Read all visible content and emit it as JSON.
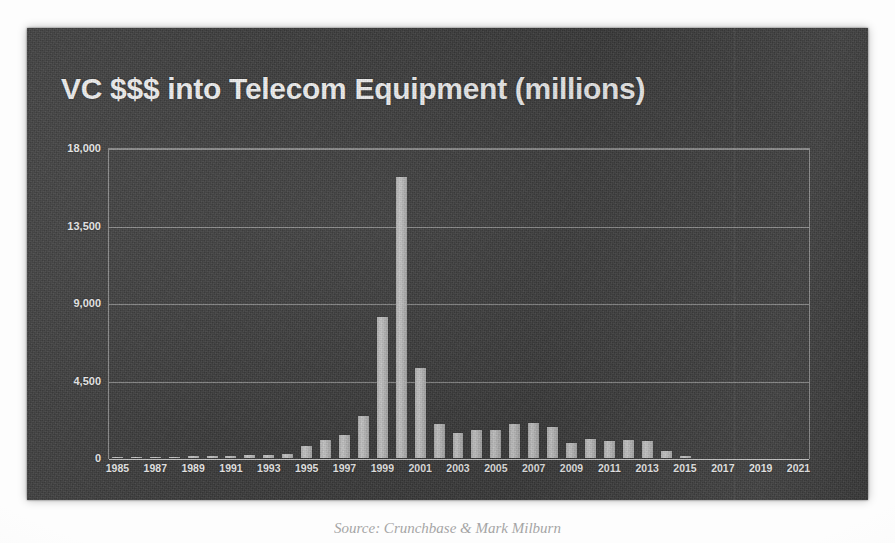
{
  "slide": {
    "title": "VC $$$ into Telecom Equipment (millions)",
    "background_color": "#3b3b3b",
    "title_color": "#f2f2f2",
    "bar_color": "#c2c2c2",
    "grid_color": "#e4e4e4"
  },
  "caption": {
    "text": "Source: Crunchbase & Mark Milburn"
  },
  "chart_data": {
    "type": "bar",
    "title": "VC $$$ into Telecom Equipment (millions)",
    "xlabel": "",
    "ylabel": "",
    "ylim": [
      0,
      18000
    ],
    "yticks": [
      0,
      4500,
      9000,
      13500,
      18000
    ],
    "ytick_labels": [
      "0",
      "4,500",
      "9,000",
      "13,500",
      "18,000"
    ],
    "grid": true,
    "legend": false,
    "xtick_labels": [
      "1985",
      "1987",
      "1989",
      "1991",
      "1993",
      "1995",
      "1997",
      "1999",
      "2001",
      "2003",
      "2005",
      "2007",
      "2009",
      "2011",
      "2013",
      "2015",
      "2017",
      "2019",
      "2021"
    ],
    "categories": [
      "1985",
      "1986",
      "1987",
      "1988",
      "1989",
      "1990",
      "1991",
      "1992",
      "1993",
      "1994",
      "1995",
      "1996",
      "1997",
      "1998",
      "1999",
      "2000",
      "2001",
      "2002",
      "2003",
      "2004",
      "2005",
      "2006",
      "2007",
      "2008",
      "2009",
      "2010",
      "2011",
      "2012",
      "2013",
      "2014",
      "2015",
      "2016",
      "2017",
      "2018",
      "2019",
      "2020",
      "2021"
    ],
    "values": [
      40,
      55,
      70,
      60,
      90,
      110,
      130,
      150,
      180,
      260,
      700,
      1050,
      1350,
      2450,
      8200,
      16300,
      5200,
      1950,
      1450,
      1600,
      1600,
      1950,
      2050,
      1800,
      900,
      1100,
      1000,
      1050,
      1000,
      400,
      120,
      0,
      0,
      0,
      0,
      0,
      0
    ]
  }
}
